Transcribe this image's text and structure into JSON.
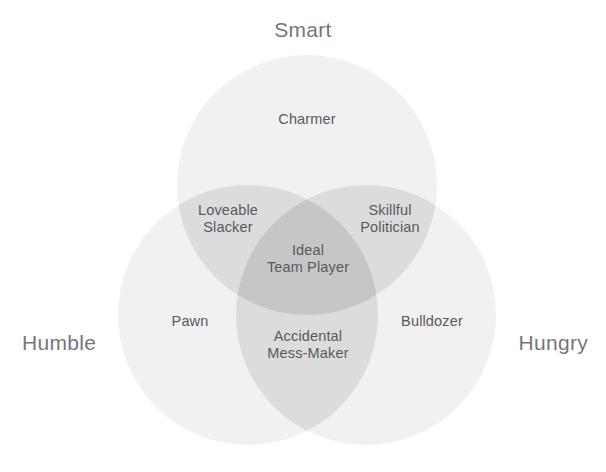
{
  "diagram": {
    "type": "venn",
    "title_present": false,
    "set_labels": [
      {
        "id": "smart",
        "label": "Smart",
        "position": "top"
      },
      {
        "id": "humble",
        "label": "Humble",
        "position": "bottom-left"
      },
      {
        "id": "hungry",
        "label": "Hungry",
        "position": "bottom-right"
      }
    ],
    "regions": [
      {
        "id": "charmer",
        "label": "Charmer",
        "sets": [
          "smart"
        ],
        "overlap": 1
      },
      {
        "id": "pawn",
        "label": "Pawn",
        "sets": [
          "humble"
        ],
        "overlap": 1
      },
      {
        "id": "bulldozer",
        "label": "Bulldozer",
        "sets": [
          "hungry"
        ],
        "overlap": 1
      },
      {
        "id": "loveable-slacker",
        "label": "Loveable\nSlacker",
        "sets": [
          "smart",
          "humble"
        ],
        "overlap": 2
      },
      {
        "id": "skillful-politician",
        "label": "Skillful\nPolitician",
        "sets": [
          "smart",
          "hungry"
        ],
        "overlap": 2
      },
      {
        "id": "accidental-mess-maker",
        "label": "Accidental\nMess-Maker",
        "sets": [
          "humble",
          "hungry"
        ],
        "overlap": 2
      },
      {
        "id": "ideal-team-player",
        "label": "Ideal\nTeam Player",
        "sets": [
          "smart",
          "humble",
          "hungry"
        ],
        "overlap": 3
      }
    ],
    "colors": {
      "background": "#ffffff",
      "circle_fill": "#f1f1f1",
      "overlap_two": "#dcdcdc",
      "overlap_three": "#c6c6c6",
      "set_label_text": "#76767a",
      "region_label_text": "#59595c"
    },
    "geometry": {
      "radius": 130,
      "circles": [
        {
          "id": "smart",
          "cx": 307,
          "cy": 185
        },
        {
          "id": "humble",
          "cx": 248,
          "cy": 315
        },
        {
          "id": "hungry",
          "cx": 366,
          "cy": 315
        }
      ]
    }
  }
}
